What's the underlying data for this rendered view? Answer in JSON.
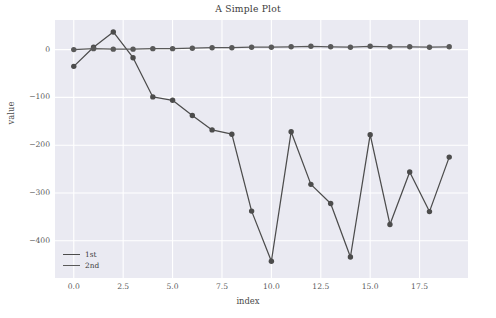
{
  "chart_data": {
    "type": "line",
    "title": "A Simple Plot",
    "xlabel": "index",
    "ylabel": "value",
    "x": [
      0,
      1,
      2,
      3,
      4,
      5,
      6,
      7,
      8,
      9,
      10,
      11,
      12,
      13,
      14,
      15,
      16,
      17,
      18,
      19
    ],
    "series": [
      {
        "name": "1st",
        "color": "#4c4c4c",
        "marker": "o",
        "values": [
          -35,
          5,
          37,
          -17,
          -99,
          -106,
          -138,
          -168,
          -177,
          -338,
          -443,
          -172,
          -282,
          -322,
          -434,
          -178,
          -366,
          -256,
          -339,
          -225
        ]
      },
      {
        "name": "2nd",
        "color": "#595959",
        "marker": "o",
        "values": [
          0,
          2,
          1,
          1,
          2,
          2,
          3,
          4,
          4,
          5,
          5,
          6,
          7,
          6,
          5,
          7,
          6,
          6,
          5,
          6
        ]
      }
    ],
    "xticks": [
      "0.0",
      "2.5",
      "5.0",
      "7.5",
      "10.0",
      "12.5",
      "15.0",
      "17.5"
    ],
    "xtick_values": [
      0,
      2.5,
      5,
      7.5,
      10,
      12.5,
      15,
      17.5
    ],
    "yticks": [
      "0",
      "-100",
      "-200",
      "-300",
      "-400"
    ],
    "ytick_values": [
      0,
      -100,
      -200,
      -300,
      -400
    ],
    "xlim": [
      -0.95,
      19.95
    ],
    "ylim": [
      -478,
      62
    ],
    "grid": true,
    "grid_color": "#ffffff",
    "axes_facecolor": "#eaeaf2",
    "figure_facecolor": "#ffffff",
    "legend": {
      "position": "lower left",
      "entries": [
        "1st",
        "2nd"
      ]
    }
  }
}
